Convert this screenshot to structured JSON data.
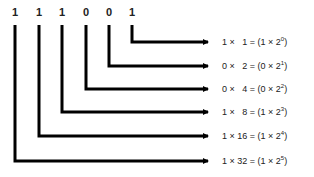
{
  "binary_number": {
    "digits": [
      "1",
      "1",
      "1",
      "0",
      "0",
      "1"
    ]
  },
  "rows": [
    {
      "bit": "1",
      "place_value": "1",
      "equation": "1 ×   1 = (1 × 2",
      "exponent": "0",
      "close": ")"
    },
    {
      "bit": "0",
      "place_value": "2",
      "equation": "0 ×   2 = (0 × 2",
      "exponent": "1",
      "close": ")"
    },
    {
      "bit": "0",
      "place_value": "4",
      "equation": "0 ×   4 = (0 × 2",
      "exponent": "2",
      "close": ")"
    },
    {
      "bit": "1",
      "place_value": "8",
      "equation": "1 ×   8 = (1 × 2",
      "exponent": "3",
      "close": ")"
    },
    {
      "bit": "1",
      "place_value": "16",
      "equation": "1 × 16 = (1 × 2",
      "exponent": "4",
      "close": ")"
    },
    {
      "bit": "1",
      "place_value": "32",
      "equation": "1 × 32 = (1 × 2",
      "exponent": "5",
      "close": ")"
    }
  ],
  "colors": {
    "line": "#000000",
    "text": "#222222",
    "background": "#ffffff"
  }
}
